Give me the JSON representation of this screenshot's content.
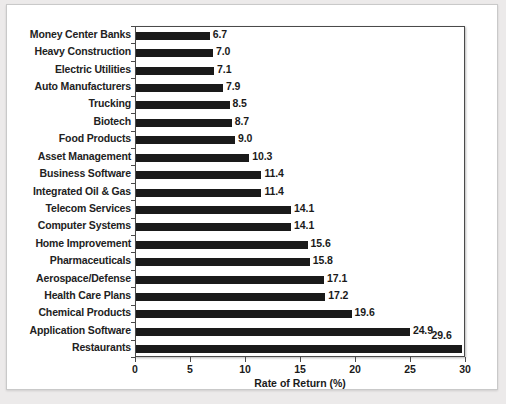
{
  "chart_data": {
    "type": "bar",
    "orientation": "horizontal",
    "title": "",
    "xlabel": "Rate of Return (%)",
    "ylabel": "",
    "xlim": [
      0,
      30
    ],
    "xticks": [
      0,
      5,
      10,
      15,
      20,
      25,
      30
    ],
    "grid": false,
    "legend": null,
    "bar_color": "#1a1a1a",
    "categories": [
      "Money Center Banks",
      "Heavy Construction",
      "Electric Utilities",
      "Auto Manufacturers",
      "Trucking",
      "Biotech",
      "Food Products",
      "Asset Management",
      "Business Software",
      "Integrated Oil & Gas",
      "Telecom Services",
      "Computer Systems",
      "Home Improvement",
      "Pharmaceuticals",
      "Aerospace/Defense",
      "Health Care Plans",
      "Chemical Products",
      "Application Software",
      "Restaurants"
    ],
    "values": [
      6.7,
      7.0,
      7.1,
      7.9,
      8.5,
      8.7,
      9.0,
      10.3,
      11.4,
      11.4,
      14.1,
      14.1,
      15.6,
      15.8,
      17.1,
      17.2,
      19.6,
      24.9,
      29.6
    ],
    "value_labels": [
      "6.7",
      "7.0",
      "7.1",
      "7.9",
      "8.5",
      "8.7",
      "9.0",
      "10.3",
      "11.4",
      "11.4",
      "14.1",
      "14.1",
      "15.6",
      "15.8",
      "17.1",
      "17.2",
      "19.6",
      "24.9",
      "29.6"
    ],
    "xtick_labels": [
      "0",
      "5",
      "10",
      "15",
      "20",
      "25",
      "30"
    ]
  }
}
